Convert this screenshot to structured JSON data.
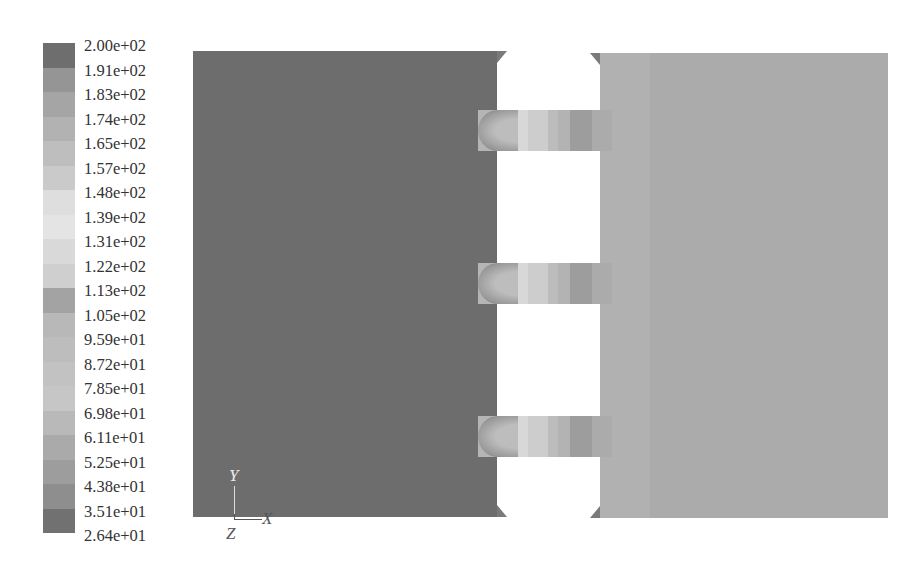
{
  "legend": {
    "labels": [
      "2.00e+02",
      "1.91e+02",
      "1.83e+02",
      "1.74e+02",
      "1.65e+02",
      "1.57e+02",
      "1.48e+02",
      "1.39e+02",
      "1.31e+02",
      "1.22e+02",
      "1.13e+02",
      "1.05e+02",
      "9.59e+01",
      "8.72e+01",
      "7.85e+01",
      "6.98e+01",
      "6.11e+01",
      "5.25e+01",
      "4.38e+01",
      "3.51e+01",
      "2.64e+01"
    ],
    "swatch_colors": [
      "#6e6e6e",
      "#959595",
      "#a5a5a5",
      "#b2b2b2",
      "#bebebe",
      "#cacaca",
      "#dedede",
      "#e4e4e4",
      "#d9d9d9",
      "#cfcfcf",
      "#a3a3a3",
      "#b8b8b8",
      "#bdbdbd",
      "#c2c2c2",
      "#c6c6c6",
      "#b9b9b9",
      "#aaaaaa",
      "#9d9d9d",
      "#8e8e8e",
      "#717171"
    ]
  },
  "geometry": {
    "left_block_color": "#6d6d6d",
    "right_block_color": "#ababab",
    "connectors": [
      {
        "name": "top",
        "top": 110
      },
      {
        "name": "middle",
        "top": 263
      },
      {
        "name": "bottom",
        "top": 416
      }
    ],
    "connector_segments": [
      {
        "left": 0,
        "width": 22,
        "color": "#b5b5b5"
      },
      {
        "left": 22,
        "width": 28,
        "color": "#d8d8d8"
      },
      {
        "left": 50,
        "width": 20,
        "color": "#cdcdcd"
      },
      {
        "left": 70,
        "width": 10,
        "color": "#bcbcbc"
      },
      {
        "left": 80,
        "width": 12,
        "color": "#b3b3b3"
      },
      {
        "left": 92,
        "width": 22,
        "color": "#9d9d9d"
      },
      {
        "left": 114,
        "width": 20,
        "color": "#ababab"
      }
    ]
  },
  "axis_triad": {
    "y": "Y",
    "x": "X",
    "z": "Z"
  }
}
